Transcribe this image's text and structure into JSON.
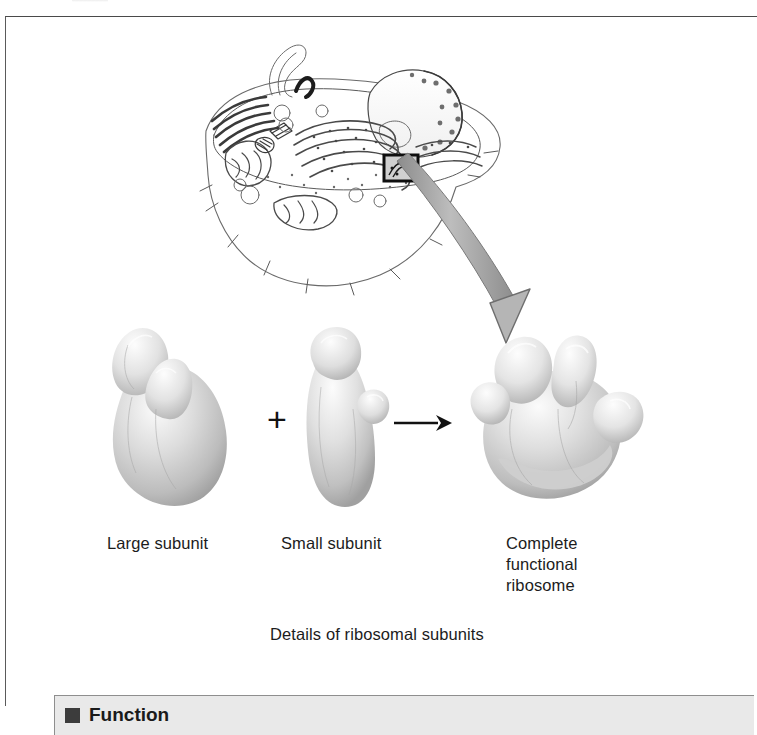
{
  "figure": {
    "frame_border_color": "#4a4a4a",
    "background": "#ffffff",
    "top_remnant": ""
  },
  "cell_diagram": {
    "name": "eukaryotic-cell-line-drawing",
    "callout_box_label": "",
    "description": "Line drawing of a eukaryotic cell showing nucleus, rough and smooth endoplasmic reticulum, Golgi apparatus, mitochondria, centriole and cytoskeleton, with a small black rectangle marking ribosomes on the rough ER"
  },
  "diagram": {
    "plus_symbol": "+",
    "arrow_symbol": "→"
  },
  "labels": {
    "large_subunit": "Large subunit",
    "small_subunit": "Small subunit",
    "complete_ribosome": "Complete\nfunctional\nribosome"
  },
  "caption": {
    "details": "Details of ribosomal subunits"
  },
  "function_panel": {
    "heading": "Function"
  },
  "colors": {
    "ink": "#1a1a1a",
    "blob_light": "#f2f2f2",
    "blob_mid": "#c9c9c9",
    "blob_shadow": "#8f8f8f",
    "arrow_gray": "#9b9b9b",
    "panel_fill": "#e9e9e9"
  }
}
